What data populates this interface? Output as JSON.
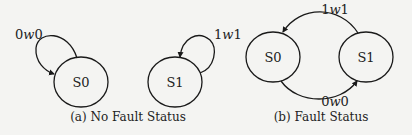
{
  "figure": {
    "subfigures": [
      {
        "caption": "(a) No Fault Status",
        "states": [
          {
            "id": "S0",
            "label": "S0"
          },
          {
            "id": "S1",
            "label": "S1"
          }
        ],
        "transitions": [
          {
            "from": "S0",
            "to": "S0",
            "label_pre": "0",
            "label_op": "w",
            "label_post": "0"
          },
          {
            "from": "S1",
            "to": "S1",
            "label_pre": "1",
            "label_op": "w",
            "label_post": "1"
          }
        ]
      },
      {
        "caption": "(b) Fault Status",
        "states": [
          {
            "id": "S0",
            "label": "S0"
          },
          {
            "id": "S1",
            "label": "S1"
          }
        ],
        "transitions": [
          {
            "from": "S1",
            "to": "S0",
            "label_pre": "1",
            "label_op": "w",
            "label_post": "1"
          },
          {
            "from": "S0",
            "to": "S1",
            "label_pre": "0",
            "label_op": "w",
            "label_post": "0"
          }
        ]
      }
    ]
  },
  "colors": {
    "background": "#f4f4f2",
    "stroke": "#1a1a1a",
    "text": "#222222"
  }
}
